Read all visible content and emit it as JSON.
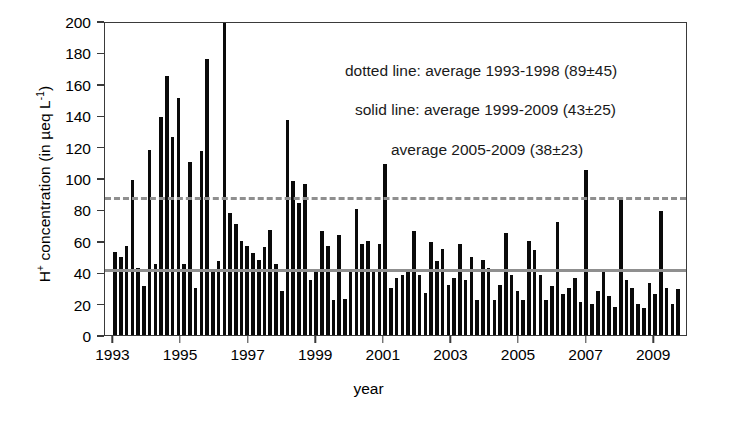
{
  "chart_data": {
    "type": "bar",
    "title": "",
    "xlabel": "year",
    "ylabel": "H+ concentration (in µeq L-1)",
    "ylabel_parts": {
      "prefix": "H",
      "sup1": "+",
      "mid": " concentration (in µeq L",
      "sup2": "-1",
      "suffix": ")"
    },
    "ylim": [
      0,
      200
    ],
    "yticks": [
      0,
      20,
      40,
      60,
      80,
      100,
      120,
      140,
      160,
      180,
      200
    ],
    "xlim": [
      1992.75,
      2010.0
    ],
    "xticks": [
      1993,
      1995,
      1997,
      1999,
      2001,
      2003,
      2005,
      2007,
      2009
    ],
    "xtick_labels": [
      "1993",
      "1995",
      "1997",
      "1999",
      "2001",
      "2003",
      "2005",
      "2007",
      "2009"
    ],
    "grid": false,
    "legend_position": "none",
    "bar_color": "#0a0a0a",
    "reference_line_color": "#8f8f8f",
    "reference_lines": [
      {
        "name": "average 1993-1998",
        "value": 89,
        "style": "dashed"
      },
      {
        "name": "average 1999-2009",
        "value": 43,
        "style": "solid"
      }
    ],
    "annotations": [
      "dotted line: average 1993-1998 (89±45)",
      "solid line: average 1999-2009 (43±25)",
      "average 2005-2009 (38±23)"
    ],
    "note_clipped_bar": "One bar in 1996 exceeds the 200 axis limit and is clipped at the top frame.",
    "x": [
      1993.05,
      1993.22,
      1993.39,
      1993.56,
      1993.73,
      1993.9,
      1994.07,
      1994.24,
      1994.41,
      1994.58,
      1994.75,
      1994.92,
      1995.09,
      1995.26,
      1995.43,
      1995.6,
      1995.77,
      1995.94,
      1996.11,
      1996.28,
      1996.45,
      1996.62,
      1996.79,
      1996.96,
      1997.13,
      1997.3,
      1997.47,
      1997.64,
      1997.81,
      1997.98,
      1998.15,
      1998.32,
      1998.49,
      1998.66,
      1998.83,
      1999.0,
      1999.17,
      1999.34,
      1999.51,
      1999.68,
      1999.85,
      2000.02,
      2000.19,
      2000.36,
      2000.53,
      2000.7,
      2000.87,
      2001.04,
      2001.21,
      2001.38,
      2001.55,
      2001.72,
      2001.89,
      2002.06,
      2002.23,
      2002.4,
      2002.57,
      2002.74,
      2002.91,
      2003.08,
      2003.25,
      2003.42,
      2003.59,
      2003.76,
      2003.93,
      2004.1,
      2004.27,
      2004.44,
      2004.61,
      2004.78,
      2004.95,
      2005.12,
      2005.29,
      2005.46,
      2005.63,
      2005.8,
      2005.97,
      2006.14,
      2006.31,
      2006.48,
      2006.65,
      2006.82,
      2006.99,
      2007.16,
      2007.33,
      2007.5,
      2007.67,
      2007.84,
      2008.01,
      2008.18,
      2008.35,
      2008.52,
      2008.69,
      2008.86,
      2009.03,
      2009.2,
      2009.37,
      2009.54,
      2009.71
    ],
    "values": [
      53,
      50,
      57,
      99,
      43,
      31,
      118,
      45,
      139,
      165,
      126,
      151,
      45,
      110,
      30,
      117,
      176,
      40,
      47,
      200,
      78,
      71,
      60,
      57,
      52,
      48,
      56,
      67,
      45,
      28,
      137,
      98,
      84,
      96,
      35,
      41,
      66,
      57,
      22,
      64,
      23,
      40,
      80,
      58,
      60,
      40,
      58,
      109,
      30,
      36,
      38,
      42,
      66,
      38,
      27,
      59,
      47,
      55,
      32,
      36,
      58,
      35,
      50,
      22,
      48,
      43,
      22,
      32,
      65,
      38,
      28,
      22,
      60,
      54,
      38,
      22,
      31,
      72,
      26,
      30,
      36,
      21,
      105,
      20,
      28,
      42,
      25,
      18,
      86,
      35,
      30,
      20,
      17,
      33,
      26,
      79,
      30,
      20,
      29
    ]
  }
}
